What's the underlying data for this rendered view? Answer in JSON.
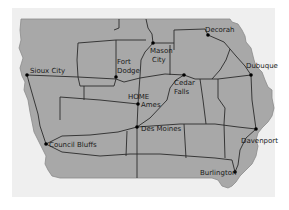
{
  "map": {
    "region": "Iowa",
    "colors": {
      "background": "#ffffff",
      "panel": "#efefef",
      "land": "#a8a8a8",
      "roads": "#2a2a2a",
      "text": "#1a1a1a"
    },
    "cities": [
      {
        "id": "sioux-city",
        "label": "Sioux City",
        "x": 27,
        "y": 75,
        "lx": 30,
        "ly": 72
      },
      {
        "id": "fort-dodge",
        "label_lines": [
          "Fort",
          "Dodge"
        ],
        "x": 116,
        "y": 76
      },
      {
        "id": "mason-city",
        "label_lines": [
          "Mason",
          "City"
        ],
        "x": 153,
        "y": 43
      },
      {
        "id": "decorah",
        "label": "Decorah",
        "x": 208,
        "y": 35
      },
      {
        "id": "dubuque",
        "label": "Dubuque",
        "x": 251,
        "y": 75
      },
      {
        "id": "cedar-falls",
        "label_lines": [
          "Cedar",
          "Falls"
        ],
        "x": 184,
        "y": 75
      },
      {
        "id": "ames",
        "label": "Ames",
        "x": 138,
        "y": 104,
        "home_label": "HOME"
      },
      {
        "id": "des-moines",
        "label": "Des Moines",
        "x": 137,
        "y": 127
      },
      {
        "id": "council-bluffs",
        "label": "Council Bluffs",
        "x": 46,
        "y": 144
      },
      {
        "id": "davenport",
        "label": "Davenport",
        "x": 256,
        "y": 129
      },
      {
        "id": "burlington",
        "label": "Burlington",
        "x": 235,
        "y": 172
      }
    ]
  },
  "labels": {
    "sioux_city": "Sioux City",
    "fort": "Fort",
    "dodge": "Dodge",
    "mason": "Mason",
    "city": "City",
    "decorah": "Decorah",
    "dubuque": "Dubuque",
    "cedar": "Cedar",
    "falls": "Falls",
    "home": "HOME",
    "ames": "Ames",
    "des_moines": "Des Moines",
    "council_bluffs": "Council Bluffs",
    "davenport": "Davenport",
    "burlington": "Burlington"
  }
}
